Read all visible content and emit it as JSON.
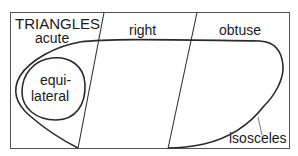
{
  "diagram": {
    "title": "TRIANGLES",
    "regions": {
      "acute": "acute",
      "right": "right",
      "obtuse": "obtuse"
    },
    "sets": {
      "equilateral_line1": "equi-",
      "equilateral_line2": "lateral",
      "isosceles": "isosceles"
    },
    "colors": {
      "line": "#2a2a2a",
      "frame": "#555555",
      "background": "#ffffff"
    }
  }
}
